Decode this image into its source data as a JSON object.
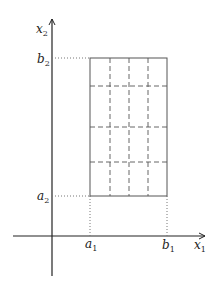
{
  "diagram": {
    "type": "partition-of-rectangle",
    "axes": {
      "x": {
        "label": "x",
        "subscript": "1"
      },
      "y": {
        "label": "x",
        "subscript": "2"
      }
    },
    "ticks": {
      "a1": {
        "label": "a",
        "subscript": "1"
      },
      "b1": {
        "label": "b",
        "subscript": "1"
      },
      "a2": {
        "label": "a",
        "subscript": "2"
      },
      "b2": {
        "label": "b",
        "subscript": "2"
      }
    },
    "grid": {
      "columns": 4,
      "rows": 4
    },
    "colors": {
      "axis": "#222222",
      "rect": "#555555",
      "dashed": "#555555",
      "dotted": "#777777"
    }
  }
}
